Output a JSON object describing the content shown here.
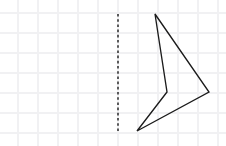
{
  "diagram": {
    "canvas": {
      "width": 226,
      "height": 146,
      "background_color": "#ffffff"
    },
    "grid": {
      "label": "graph-paper-grid",
      "spacing_px": 20,
      "color": "#f1f1f3",
      "line_width": 1.6,
      "vertical_x": [
        18,
        38,
        58,
        78,
        98,
        118,
        138,
        158,
        178,
        198,
        218
      ],
      "horizontal_y": [
        13,
        33,
        53,
        73,
        93,
        113,
        133
      ]
    },
    "mirror_line": {
      "label": "line of reflection",
      "orientation": "vertical",
      "x": 118,
      "y_start": 14,
      "y_end": 132,
      "color": "#1a1a1a",
      "style": "dashed",
      "dash_pattern": "2.6 2.6",
      "line_width": 1.4
    },
    "shape": {
      "label": "concave arrow quadrilateral",
      "type": "polygon",
      "sides": 4,
      "concave": true,
      "color": "#1b1b1b",
      "fill": "none",
      "line_width": 1.35,
      "points": "155,14 209,92 137,131 167,92",
      "vertices": [
        {
          "name": "top-vertex",
          "x": 155,
          "y": 14,
          "angle_type": "acute"
        },
        {
          "name": "right-vertex",
          "x": 209,
          "y": 92,
          "angle_type": "acute"
        },
        {
          "name": "bottom-vertex",
          "x": 137,
          "y": 131,
          "angle_type": "acute"
        },
        {
          "name": "reflex-vertex",
          "x": 167,
          "y": 92,
          "angle_type": "reflex"
        }
      ]
    }
  }
}
